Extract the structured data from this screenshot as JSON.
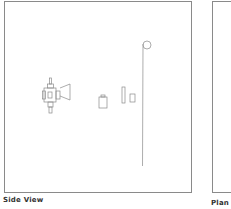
{
  "views": {
    "side": {
      "label": "Side View"
    },
    "plan": {
      "label": "Plan View"
    }
  },
  "colors": {
    "stroke": "#8a8a8a",
    "label": "#333333",
    "background": "#ffffff"
  },
  "elements": [
    {
      "name": "light-fixture",
      "icon": "spotlight-with-barn-door"
    },
    {
      "name": "battery-pack",
      "icon": "battery"
    },
    {
      "name": "tall-panel",
      "icon": "rectangle"
    },
    {
      "name": "small-panel",
      "icon": "rectangle"
    },
    {
      "name": "boom-stand",
      "icon": "pole-with-ring"
    }
  ]
}
